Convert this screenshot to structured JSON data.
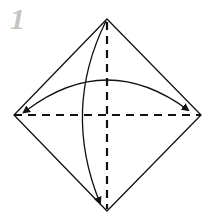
{
  "diagram": {
    "step_number": "1",
    "colors": {
      "line": "#111111",
      "step_number": "#c4c4c4",
      "background": "#ffffff"
    },
    "square": {
      "top": [
        107,
        19
      ],
      "right": [
        201,
        115
      ],
      "bottom": [
        107,
        211
      ],
      "left": [
        14,
        115
      ]
    },
    "folds": [
      {
        "name": "horizontal-valley-fold",
        "from": [
          14,
          115
        ],
        "to": [
          201,
          115
        ],
        "style": "dashed"
      },
      {
        "name": "vertical-valley-fold",
        "from": [
          107,
          19
        ],
        "to": [
          107,
          211
        ],
        "style": "dashed"
      }
    ],
    "arrows": [
      {
        "name": "horizontal-fold-arrow",
        "description": "fold left and right corners together",
        "direction": "both"
      },
      {
        "name": "vertical-fold-arrow",
        "description": "fold top corner to bottom corner",
        "direction": "down"
      }
    ]
  }
}
